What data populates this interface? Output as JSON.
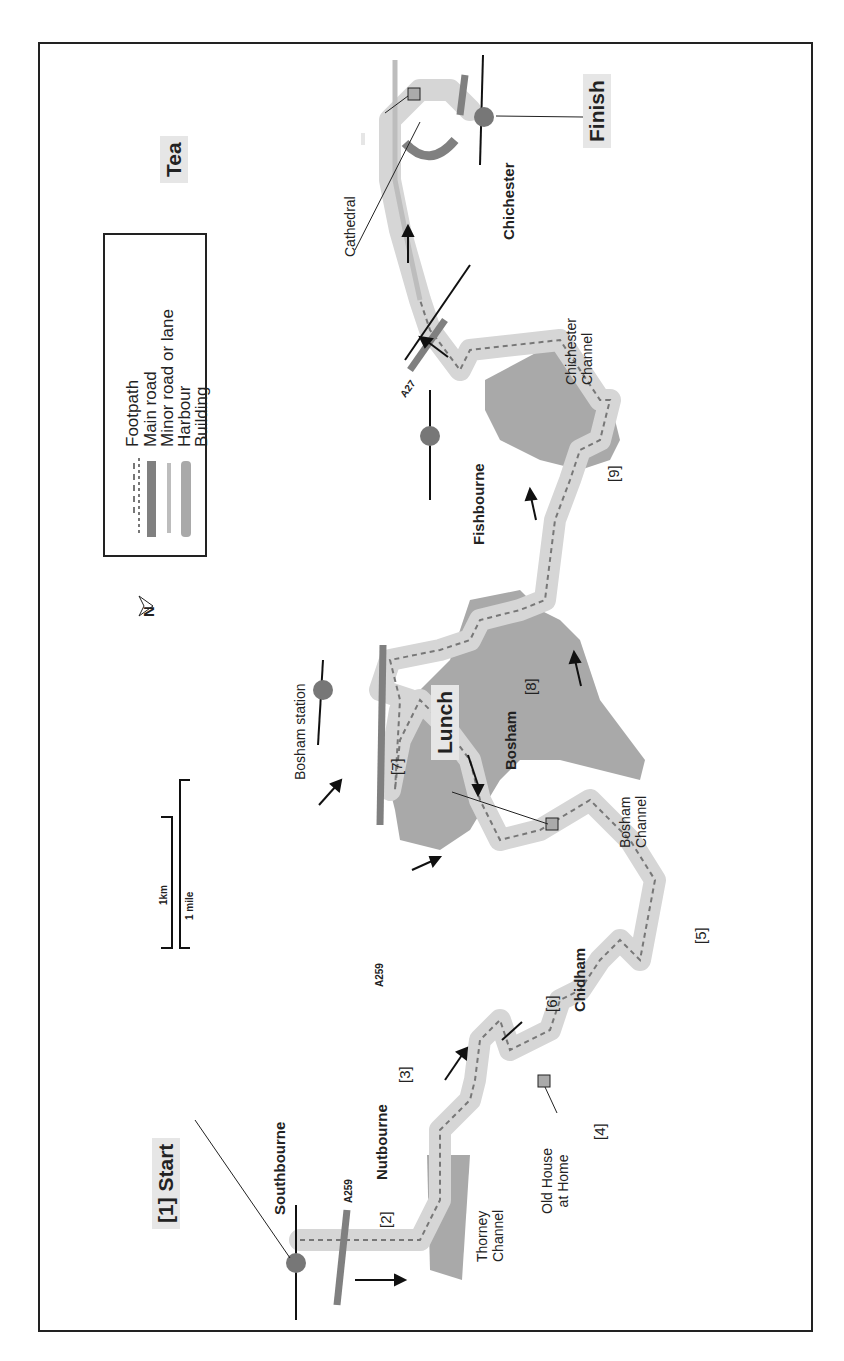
{
  "map": {
    "title_points": {
      "start": "[1] Start",
      "finish": "Finish",
      "lunch": "Lunch",
      "tea": "Tea"
    },
    "places": [
      "Southbourne",
      "Nutbourne",
      "Chidham",
      "Bosham",
      "Fishbourne",
      "Chichester"
    ],
    "features": {
      "bosham_station": "Bosham station",
      "cathedral": "Cathedral",
      "old_house": [
        "Old House",
        "at Home"
      ],
      "thorney_channel": [
        "Thorney",
        "Channel"
      ],
      "bosham_channel": [
        "Bosham",
        "Channel"
      ],
      "chichester_channel": [
        "Chichester",
        "Channel"
      ]
    },
    "roads": {
      "a259_west": "A259",
      "a259_mid": "A259",
      "a27": "A27"
    },
    "waypoints": [
      "[2]",
      "[3]",
      "[4]",
      "[5]",
      "[6]",
      "[7]",
      "[8]",
      "[9]"
    ],
    "scale": {
      "km": "1km",
      "mile": "1 mile"
    },
    "north": "N"
  },
  "legend": {
    "items": [
      {
        "label": "Footpath",
        "symbol": "dashed-line"
      },
      {
        "label": "Main road",
        "symbol": "thick-dark-line"
      },
      {
        "label": "Minor road or lane",
        "symbol": "thin-light-line"
      },
      {
        "label": "Harbour",
        "symbol": "grey-shape"
      },
      {
        "label": "Building",
        "symbol": "grey-square"
      }
    ]
  },
  "colors": {
    "route_band": "#d6d6d6",
    "harbour": "#a9a9a9",
    "main_road": "#808080",
    "minor_road": "#bdbdbd",
    "footpath": "#777777",
    "station_dot": "#777777",
    "label_box": "#e6e6e6"
  }
}
